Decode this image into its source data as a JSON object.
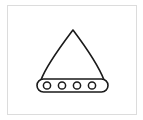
{
  "canvas": {
    "width": 143,
    "height": 120,
    "background_color": "#ffffff"
  },
  "frame": {
    "name": "image-frame",
    "border_color": "#dcdcdc",
    "border_width": 1,
    "x": 7,
    "y": 5,
    "width": 130,
    "height": 110
  },
  "drawing": {
    "title": "line-art tent-shape on circled base",
    "stroke_color": "#1a1a1a",
    "fill_color": "#ffffff",
    "stroke_width": 1.6,
    "body": {
      "name": "curved-triangle-body",
      "apex": {
        "x": 73,
        "y": 30
      },
      "left_foot": {
        "x": 41,
        "y": 80
      },
      "right_foot": {
        "x": 104,
        "y": 80
      },
      "left_edge_control": {
        "x": 52,
        "y": 48
      },
      "right_edge_control": {
        "x": 94,
        "y": 48
      },
      "path": "M73,30 C64,42 47,64 41,80 L104,80 C98,64 82,42 73,30 Z"
    },
    "base_bar": {
      "name": "rounded-base-bar",
      "x": 37,
      "y": 79,
      "width": 71,
      "height": 13,
      "corner_radius": 6.5
    },
    "circles": [
      {
        "name": "base-circle-1",
        "cx": 47,
        "cy": 85.5,
        "r": 3.6
      },
      {
        "name": "base-circle-2",
        "cx": 62,
        "cy": 85.5,
        "r": 3.6
      },
      {
        "name": "base-circle-3",
        "cx": 77,
        "cy": 85.5,
        "r": 3.6
      },
      {
        "name": "base-circle-4",
        "cx": 92,
        "cy": 85.5,
        "r": 3.6
      }
    ]
  }
}
